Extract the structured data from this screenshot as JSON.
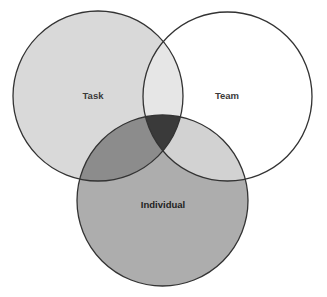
{
  "diagram": {
    "type": "venn",
    "circles": [
      {
        "id": "task",
        "label": "Task",
        "cx": 98,
        "cy": 96,
        "r": 85,
        "fill": "#d9d9d9",
        "label_x": 93,
        "label_y": 99,
        "label_color": "#3a3a3a"
      },
      {
        "id": "team",
        "label": "Team",
        "cx": 227.5,
        "cy": 96.5,
        "r": 84.5,
        "fill": "#ffffff",
        "label_x": 227,
        "label_y": 99,
        "label_color": "#3a3a3a"
      },
      {
        "id": "individual",
        "label": "Individual",
        "cx": 162.5,
        "cy": 200.5,
        "r": 85.5,
        "fill": "#adadad",
        "label_x": 163,
        "label_y": 208,
        "label_color": "#1e1e1e"
      }
    ],
    "overlaps": {
      "task_team": "#e6e6e6",
      "task_individual": "#8c8c8c",
      "team_individual": "#d2d2d2",
      "all_three": "#3a3a3a"
    },
    "stroke_color": "#333333"
  }
}
